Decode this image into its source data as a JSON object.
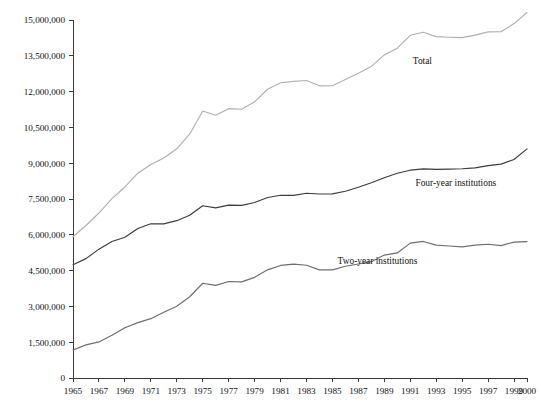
{
  "chart_data": {
    "type": "line",
    "title": "",
    "subtitle": "",
    "xlabel": "",
    "ylabel": "",
    "grid": false,
    "legend_position": "inline-right-of-series",
    "xlim": [
      1965,
      2000
    ],
    "ylim": [
      0,
      15000000
    ],
    "x": [
      1965,
      1966,
      1967,
      1968,
      1969,
      1970,
      1971,
      1972,
      1973,
      1974,
      1975,
      1976,
      1977,
      1978,
      1979,
      1980,
      1981,
      1982,
      1983,
      1984,
      1985,
      1986,
      1987,
      1988,
      1989,
      1990,
      1991,
      1992,
      1993,
      1994,
      1995,
      1996,
      1997,
      1998,
      1999,
      2000
    ],
    "xticks": [
      1965,
      1967,
      1969,
      1971,
      1973,
      1975,
      1977,
      1979,
      1981,
      1983,
      1985,
      1987,
      1989,
      1991,
      1993,
      1995,
      1997,
      1999,
      2000
    ],
    "xtick_labels": [
      "1965",
      "1967",
      "1969",
      "1971",
      "1973",
      "1975",
      "1977",
      "1979",
      "1981",
      "1983",
      "1985",
      "1987",
      "1989",
      "1991",
      "1993",
      "1995",
      "1997",
      "1999",
      "2000"
    ],
    "yticks": [
      0,
      1500000,
      3000000,
      4500000,
      6000000,
      7500000,
      9000000,
      10500000,
      12000000,
      13500000,
      15000000
    ],
    "ytick_labels": [
      "0",
      "1,500,000",
      "3,000,000",
      "4,500,000",
      "6,000,000",
      "7,500,000",
      "9,000,000",
      "10,500,000",
      "12,000,000",
      "13,500,000",
      "15,000,000"
    ],
    "series": [
      {
        "name": "Total",
        "color": "#b0b0b0",
        "label_x": 1991.2,
        "label_y": 13150000,
        "values": [
          5920000,
          6390000,
          6912000,
          7513000,
          8005000,
          8581000,
          8949000,
          9215000,
          9602000,
          10224000,
          11185000,
          11012000,
          11286000,
          11260000,
          11570000,
          12097000,
          12372000,
          12426000,
          12465000,
          12242000,
          12247000,
          12504000,
          12767000,
          13055000,
          13539000,
          13819000,
          14359000,
          14487000,
          14305000,
          14279000,
          14262000,
          14368000,
          14502000,
          14507000,
          14850000,
          15312000
        ]
      },
      {
        "name": "Four-year institutions",
        "color": "#3c3c3c",
        "label_x": 1991.4,
        "label_y": 8050000,
        "values": [
          4748000,
          5002000,
          5399000,
          5721000,
          5897000,
          6262000,
          6463000,
          6459000,
          6592000,
          6820000,
          7215000,
          7129000,
          7243000,
          7232000,
          7353000,
          7565000,
          7655000,
          7654000,
          7741000,
          7711000,
          7716000,
          7824000,
          7990000,
          8180000,
          8388000,
          8579000,
          8707000,
          8765000,
          8739000,
          8749000,
          8769000,
          8803000,
          8897000,
          8960000,
          9156000,
          9600000
        ]
      },
      {
        "name": "Two-year institutions",
        "color": "#6e6e6e",
        "label_x": 1985.4,
        "label_y": 4790000,
        "values": [
          1172000,
          1388000,
          1513000,
          1792000,
          2108000,
          2319000,
          2486000,
          2756000,
          3010000,
          3404000,
          3970000,
          3883000,
          4043000,
          4028000,
          4217000,
          4532000,
          4717000,
          4772000,
          4724000,
          4531000,
          4531000,
          4680000,
          4777000,
          4875000,
          5151000,
          5240000,
          5652000,
          5722000,
          5566000,
          5530000,
          5493000,
          5565000,
          5605000,
          5547000,
          5694000,
          5712000
        ]
      }
    ]
  },
  "axes": {
    "y_axis_name": "enrollment-axis",
    "x_axis_name": "year-axis"
  }
}
